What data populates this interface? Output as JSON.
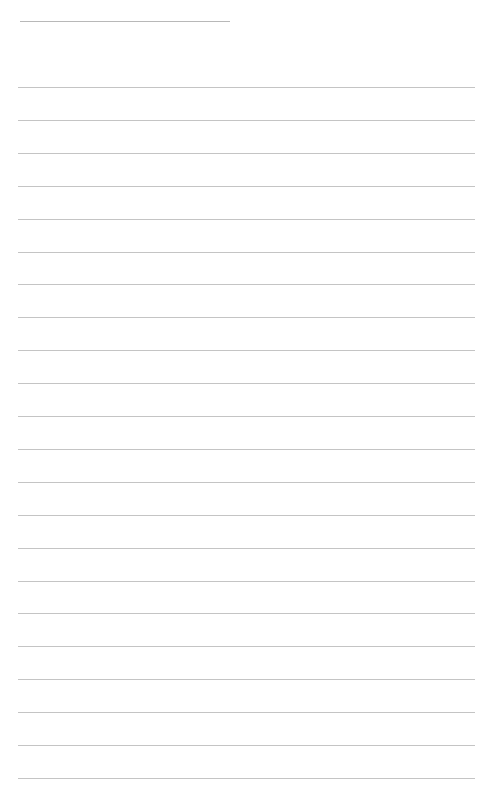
{
  "page": {
    "type": "lined-paper",
    "header_line": {
      "present": true
    },
    "rule_count": 22,
    "rule_color": "#c4c4c4",
    "background": "#ffffff"
  }
}
